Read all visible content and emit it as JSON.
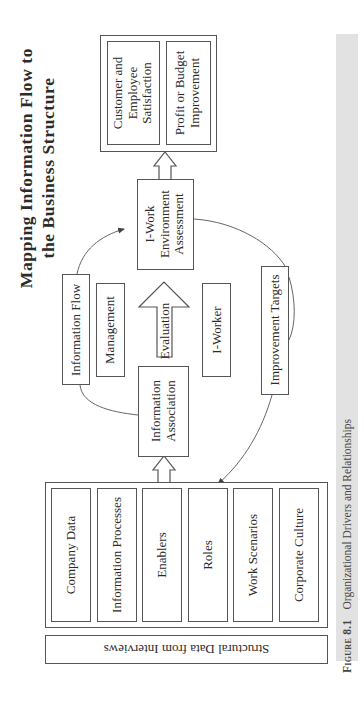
{
  "title": {
    "line1": "Mapping Information Flow to",
    "line2": "the Business Structure"
  },
  "outcomes": {
    "items": [
      {
        "label_lines": [
          "Customer and",
          "Employee",
          "Satisfaction"
        ]
      },
      {
        "label_lines": [
          "Profit or Budget",
          "Improvement"
        ]
      }
    ]
  },
  "assessment": {
    "label_lines": [
      "I-Work",
      "Environment",
      "Assessment"
    ]
  },
  "information_flow": {
    "label": "Information Flow"
  },
  "management": {
    "label": "Management"
  },
  "evaluation": {
    "label": "Evaluation"
  },
  "i_worker": {
    "label": "I-Worker"
  },
  "improvement_targets": {
    "label": "Improvement Targets"
  },
  "information_association": {
    "label_lines": [
      "Information",
      "Association"
    ]
  },
  "structure": {
    "items": [
      {
        "label": "Company Data"
      },
      {
        "label": "Information Processes"
      },
      {
        "label": "Enablers"
      },
      {
        "label": "Roles"
      },
      {
        "label": "Work Scenarios"
      },
      {
        "label": "Corporate Culture"
      }
    ]
  },
  "source": {
    "label": "Structural Data from Interviews"
  },
  "caption": {
    "figure_number": "Figure 8.1",
    "text": "Organizational Drivers and Relationships"
  },
  "colors": {
    "line": "#555555",
    "caption_bar": "#e2e2e2",
    "text": "#2b2b2b"
  }
}
